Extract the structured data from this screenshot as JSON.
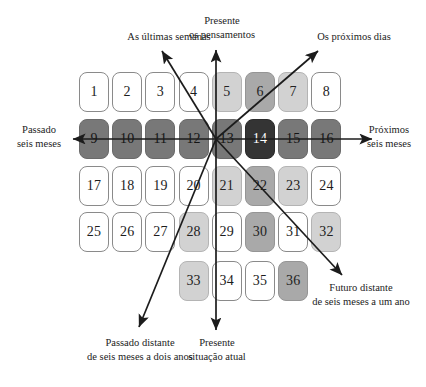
{
  "diagram": {
    "grid": {
      "rows": [
        {
          "row_index": 1,
          "start_col": 1,
          "cells": [
            {
              "n": "1",
              "shade": "white"
            },
            {
              "n": "2",
              "shade": "white"
            },
            {
              "n": "3",
              "shade": "white"
            },
            {
              "n": "4",
              "shade": "white"
            },
            {
              "n": "5",
              "shade": "light"
            },
            {
              "n": "6",
              "shade": "medium"
            },
            {
              "n": "7",
              "shade": "light"
            },
            {
              "n": "8",
              "shade": "white"
            }
          ]
        },
        {
          "row_index": 2,
          "start_col": 1,
          "cells": [
            {
              "n": "9",
              "shade": "dark"
            },
            {
              "n": "10",
              "shade": "dark"
            },
            {
              "n": "11",
              "shade": "dark"
            },
            {
              "n": "12",
              "shade": "dark"
            },
            {
              "n": "13",
              "shade": "dark"
            },
            {
              "n": "14",
              "shade": "black"
            },
            {
              "n": "15",
              "shade": "dark"
            },
            {
              "n": "16",
              "shade": "dark"
            }
          ]
        },
        {
          "row_index": 3,
          "start_col": 1,
          "cells": [
            {
              "n": "17",
              "shade": "white"
            },
            {
              "n": "18",
              "shade": "white"
            },
            {
              "n": "19",
              "shade": "white"
            },
            {
              "n": "20",
              "shade": "white"
            },
            {
              "n": "21",
              "shade": "light"
            },
            {
              "n": "22",
              "shade": "medium"
            },
            {
              "n": "23",
              "shade": "light"
            },
            {
              "n": "24",
              "shade": "white"
            }
          ]
        },
        {
          "row_index": 4,
          "start_col": 1,
          "cells": [
            {
              "n": "25",
              "shade": "white"
            },
            {
              "n": "26",
              "shade": "white"
            },
            {
              "n": "27",
              "shade": "white"
            },
            {
              "n": "28",
              "shade": "light"
            },
            {
              "n": "29",
              "shade": "white"
            },
            {
              "n": "30",
              "shade": "medium"
            },
            {
              "n": "31",
              "shade": "white"
            },
            {
              "n": "32",
              "shade": "light"
            }
          ]
        },
        {
          "row_index": 5,
          "start_col": 4,
          "cells": [
            {
              "n": "33",
              "shade": "light"
            },
            {
              "n": "34",
              "shade": "white"
            },
            {
              "n": "35",
              "shade": "white"
            },
            {
              "n": "36",
              "shade": "medium"
            }
          ]
        }
      ]
    },
    "labels": {
      "top_left": {
        "lines": [
          "As últimas semanas"
        ]
      },
      "top_center": {
        "lines": [
          "Presente",
          "os pensamentos"
        ]
      },
      "top_right": {
        "lines": [
          "Os próximos dias"
        ]
      },
      "left": {
        "lines": [
          "Passado",
          "seis meses"
        ]
      },
      "right": {
        "lines": [
          "Próximos",
          "seis meses"
        ]
      },
      "bottom_left": {
        "lines": [
          "Passado distante",
          "de seis meses a dois anos"
        ]
      },
      "bottom_center": {
        "lines": [
          "Presente",
          "situação atual"
        ]
      },
      "bottom_right": {
        "lines": [
          "Futuro distante",
          "de seis meses a um ano"
        ]
      }
    },
    "colors": {
      "white": "#ffffff",
      "light": "#d2d2d2",
      "medium": "#a9a9a9",
      "dark": "#787878",
      "black": "#343434",
      "stroke": "#1c1c1c",
      "cell_border": "#7e7e7e"
    }
  }
}
